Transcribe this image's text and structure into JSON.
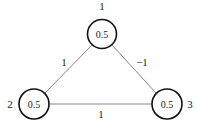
{
  "diagram": {
    "type": "graph",
    "nodes": [
      {
        "id": "1",
        "label": "1",
        "value": "0.5"
      },
      {
        "id": "2",
        "label": "2",
        "value": "0.5"
      },
      {
        "id": "3",
        "label": "3",
        "value": "0.5"
      }
    ],
    "edges": [
      {
        "from": "1",
        "to": "2",
        "weight": "1"
      },
      {
        "from": "1",
        "to": "3",
        "weight": "−1"
      },
      {
        "from": "2",
        "to": "3",
        "weight": "1"
      }
    ]
  }
}
